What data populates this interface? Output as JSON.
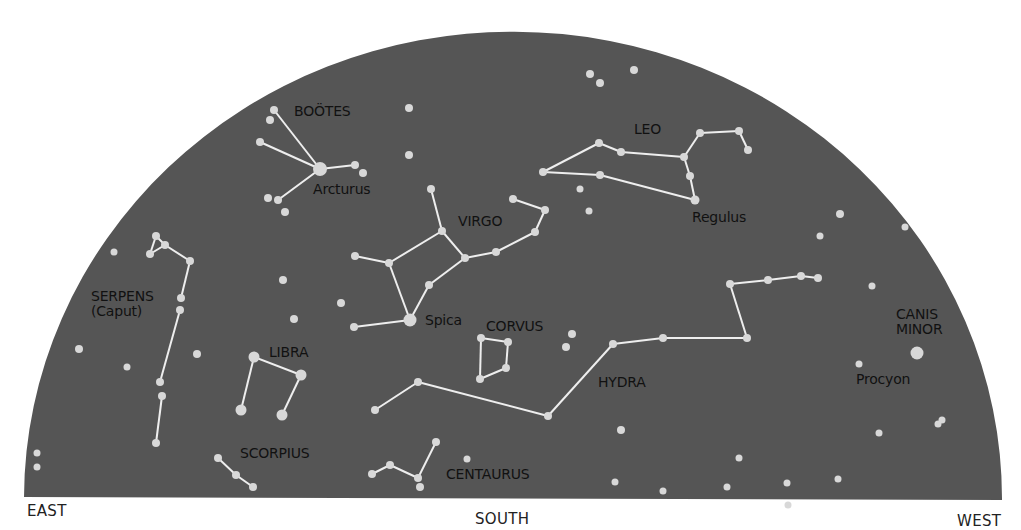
{
  "colors": {
    "sky": "#555555",
    "star": "#d8d8d8",
    "line": "#eeeeee",
    "label": "#111111",
    "background": "#ffffff"
  },
  "directions": [
    {
      "id": "east",
      "label": "EAST",
      "x": 27,
      "y": 502
    },
    {
      "id": "south",
      "label": "SOUTH",
      "x": 475,
      "y": 510
    },
    {
      "id": "west",
      "label": "WEST",
      "x": 957,
      "y": 512
    }
  ],
  "constellation_labels": [
    {
      "id": "bootes",
      "label": "BOOTES",
      "display": "BOÖTES",
      "x": 294,
      "y": 104
    },
    {
      "id": "leo",
      "label": "LEO",
      "x": 634,
      "y": 122
    },
    {
      "id": "virgo",
      "label": "VIRGO",
      "x": 458,
      "y": 214
    },
    {
      "id": "serpens",
      "label": "SERPENS\n(Caput)",
      "x": 91,
      "y": 289
    },
    {
      "id": "libra",
      "label": "LIBRA",
      "x": 269,
      "y": 345
    },
    {
      "id": "corvus",
      "label": "CORVUS",
      "x": 486,
      "y": 319
    },
    {
      "id": "hydra",
      "label": "HYDRA",
      "x": 598,
      "y": 375
    },
    {
      "id": "scorpius",
      "label": "SCORPIUS",
      "x": 240,
      "y": 446
    },
    {
      "id": "centaurus",
      "label": "CENTAURUS",
      "x": 446,
      "y": 467
    },
    {
      "id": "canis-minor",
      "label": "CANIS\nMINOR",
      "x": 896,
      "y": 307
    }
  ],
  "star_labels": [
    {
      "id": "arcturus",
      "label": "Arcturus",
      "x": 313,
      "y": 182
    },
    {
      "id": "regulus",
      "label": "Regulus",
      "x": 692,
      "y": 210
    },
    {
      "id": "spica",
      "label": "Spica",
      "x": 425,
      "y": 313
    },
    {
      "id": "procyon",
      "label": "Procyon",
      "x": 856,
      "y": 372
    }
  ],
  "chart_data": {
    "type": "diagram",
    "title": "",
    "sky_dome": {
      "left": 24,
      "right": 1002,
      "bottom": 497,
      "top": 30
    },
    "constellations": [
      {
        "name": "BOOTES",
        "stars": [
          [
            274,
            110,
            4
          ],
          [
            270,
            120,
            4
          ],
          [
            260,
            142,
            4
          ],
          [
            320,
            169,
            7
          ],
          [
            355,
            165,
            4
          ],
          [
            363,
            173,
            4
          ],
          [
            268,
            198,
            4
          ],
          [
            278,
            200,
            4
          ],
          [
            285,
            212,
            4
          ]
        ],
        "lines": [
          [
            0,
            3
          ],
          [
            2,
            3
          ],
          [
            3,
            4
          ],
          [
            3,
            7
          ]
        ]
      },
      {
        "name": "LEO",
        "stars": [
          [
            543,
            172,
            4
          ],
          [
            599,
            143,
            4
          ],
          [
            621,
            152,
            4
          ],
          [
            600,
            175,
            4
          ],
          [
            684,
            157,
            4
          ],
          [
            700,
            133,
            4
          ],
          [
            739,
            131,
            4
          ],
          [
            748,
            150,
            4
          ],
          [
            690,
            176,
            4
          ],
          [
            695,
            200,
            4.5
          ]
        ],
        "lines": [
          [
            0,
            1
          ],
          [
            1,
            2
          ],
          [
            2,
            4
          ],
          [
            0,
            3
          ],
          [
            3,
            9
          ],
          [
            4,
            5
          ],
          [
            5,
            6
          ],
          [
            6,
            7
          ],
          [
            4,
            8
          ],
          [
            8,
            9
          ]
        ]
      },
      {
        "name": "VIRGO",
        "stars": [
          [
            431,
            189,
            4
          ],
          [
            442,
            231,
            4
          ],
          [
            389,
            263,
            4
          ],
          [
            355,
            256,
            4
          ],
          [
            465,
            258,
            4
          ],
          [
            496,
            252,
            4
          ],
          [
            535,
            232,
            4
          ],
          [
            545,
            210,
            4
          ],
          [
            513,
            199,
            4
          ],
          [
            429,
            285,
            4
          ],
          [
            410,
            320,
            6.5
          ],
          [
            354,
            327,
            4
          ]
        ],
        "lines": [
          [
            0,
            1
          ],
          [
            1,
            2
          ],
          [
            2,
            3
          ],
          [
            1,
            4
          ],
          [
            4,
            5
          ],
          [
            5,
            6
          ],
          [
            6,
            7
          ],
          [
            7,
            8
          ],
          [
            4,
            9
          ],
          [
            9,
            10
          ],
          [
            2,
            10
          ],
          [
            10,
            11
          ]
        ]
      },
      {
        "name": "SERPENS",
        "stars": [
          [
            156,
            236,
            4
          ],
          [
            165,
            245,
            4
          ],
          [
            150,
            254,
            4
          ],
          [
            190,
            261,
            4
          ],
          [
            181,
            298,
            4
          ],
          [
            180,
            310,
            4
          ],
          [
            160,
            382,
            4
          ],
          [
            162,
            396,
            4
          ],
          [
            156,
            443,
            4
          ]
        ],
        "lines": [
          [
            0,
            2
          ],
          [
            0,
            1
          ],
          [
            2,
            1
          ],
          [
            1,
            3
          ],
          [
            3,
            4
          ],
          [
            5,
            6
          ],
          [
            7,
            8
          ]
        ]
      },
      {
        "name": "LIBRA",
        "stars": [
          [
            254,
            357,
            5.5
          ],
          [
            301,
            375,
            5.5
          ],
          [
            241,
            410,
            5.5
          ],
          [
            282,
            415,
            5.5
          ]
        ],
        "lines": [
          [
            0,
            1
          ],
          [
            0,
            2
          ],
          [
            1,
            3
          ]
        ]
      },
      {
        "name": "SCORPIUS",
        "stars": [
          [
            218,
            458,
            4
          ],
          [
            236,
            475,
            4
          ],
          [
            253,
            487,
            4
          ]
        ],
        "lines": [
          [
            0,
            1
          ],
          [
            1,
            2
          ]
        ]
      },
      {
        "name": "CORVUS",
        "stars": [
          [
            481,
            338,
            4
          ],
          [
            508,
            342,
            4
          ],
          [
            506,
            368,
            4
          ],
          [
            480,
            379,
            4
          ]
        ],
        "lines": [
          [
            0,
            1
          ],
          [
            1,
            2
          ],
          [
            2,
            3
          ],
          [
            3,
            0
          ]
        ]
      },
      {
        "name": "HYDRA",
        "stars": [
          [
            375,
            410,
            4
          ],
          [
            418,
            382,
            4
          ],
          [
            548,
            416,
            4
          ],
          [
            613,
            344,
            4
          ],
          [
            663,
            338,
            4
          ],
          [
            747,
            338,
            4
          ],
          [
            730,
            284,
            4
          ],
          [
            768,
            280,
            4
          ],
          [
            801,
            276,
            4
          ],
          [
            818,
            278,
            4
          ]
        ],
        "lines": [
          [
            0,
            1
          ],
          [
            1,
            2
          ],
          [
            2,
            3
          ],
          [
            3,
            4
          ],
          [
            4,
            5
          ],
          [
            5,
            6
          ],
          [
            6,
            7
          ],
          [
            7,
            8
          ],
          [
            8,
            9
          ]
        ]
      },
      {
        "name": "CENTAURUS",
        "stars": [
          [
            372,
            474,
            4
          ],
          [
            390,
            465,
            4
          ],
          [
            418,
            478,
            4
          ],
          [
            420,
            487,
            4
          ],
          [
            436,
            442,
            4
          ]
        ],
        "lines": [
          [
            0,
            1
          ],
          [
            1,
            2
          ],
          [
            2,
            4
          ]
        ]
      },
      {
        "name": "CANIS MINOR",
        "stars": [
          [
            917,
            353,
            6.5
          ],
          [
            859,
            364,
            3.5
          ]
        ],
        "lines": []
      }
    ],
    "field_stars": [
      [
        590,
        74,
        4
      ],
      [
        600,
        83,
        4
      ],
      [
        634,
        70,
        4
      ],
      [
        409,
        108,
        4
      ],
      [
        409,
        155,
        4
      ],
      [
        580,
        189,
        3.5
      ],
      [
        589,
        211,
        3.5
      ],
      [
        840,
        214,
        4
      ],
      [
        820,
        236,
        3.5
      ],
      [
        905,
        227,
        3.5
      ],
      [
        114,
        252,
        3.5
      ],
      [
        283,
        280,
        4
      ],
      [
        341,
        303,
        4
      ],
      [
        294,
        319,
        4
      ],
      [
        79,
        349,
        4
      ],
      [
        197,
        354,
        4
      ],
      [
        127,
        367,
        3.5
      ],
      [
        37,
        453,
        3.5
      ],
      [
        37,
        467,
        3.5
      ],
      [
        572,
        334,
        4
      ],
      [
        566,
        347,
        4
      ],
      [
        872,
        286,
        3.5
      ],
      [
        621,
        430,
        4
      ],
      [
        739,
        458,
        3.5
      ],
      [
        615,
        482,
        3.5
      ],
      [
        663,
        491,
        3.5
      ],
      [
        727,
        487,
        3.5
      ],
      [
        787,
        483,
        3.5
      ],
      [
        879,
        433,
        3.5
      ],
      [
        938,
        424,
        3.5
      ],
      [
        942,
        420,
        3.5
      ],
      [
        467,
        459,
        3.5
      ],
      [
        838,
        479,
        3.5
      ],
      [
        788,
        505,
        3.5
      ]
    ]
  }
}
